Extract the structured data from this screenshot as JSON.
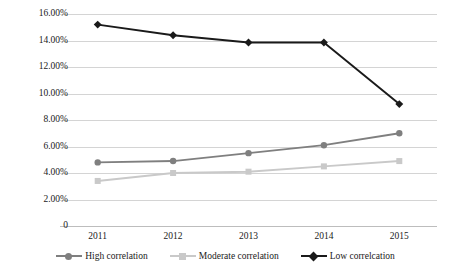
{
  "chart_data": {
    "type": "line",
    "title": "",
    "xlabel": "",
    "ylabel": "",
    "categories": [
      "2011",
      "2012",
      "2013",
      "2014",
      "2015"
    ],
    "ylim": [
      0,
      16
    ],
    "ytick_labels": [
      "16.00%",
      "14.00%",
      "12.00%",
      "10.00%",
      "8.00%",
      "6.00%",
      "4.00%",
      "2.00%",
      "0"
    ],
    "ytick_values": [
      16,
      14,
      12,
      10,
      8,
      6,
      4,
      2,
      0
    ],
    "grid": true,
    "legend_position": "bottom",
    "series": [
      {
        "name": "High correlation",
        "color": "#7f7f7f",
        "marker": "circle",
        "values": [
          4.8,
          4.9,
          5.5,
          6.1,
          7.0
        ]
      },
      {
        "name": "Moderate correlation",
        "color": "#c9c9c9",
        "marker": "square",
        "values": [
          3.4,
          4.0,
          4.1,
          4.5,
          4.9
        ]
      },
      {
        "name": "Low correlcation",
        "color": "#1a1a1a",
        "marker": "diamond",
        "values": [
          15.2,
          14.4,
          13.85,
          13.85,
          9.2
        ]
      }
    ]
  }
}
